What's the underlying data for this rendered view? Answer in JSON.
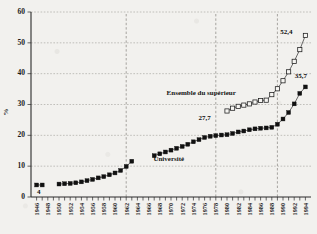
{
  "chart_data": {
    "type": "line",
    "title": "",
    "xlabel": "",
    "ylabel": "%",
    "ylim": [
      0,
      60
    ],
    "xlim": [
      1945,
      1995
    ],
    "ytick_values": [
      0,
      10,
      20,
      30,
      40,
      50,
      60
    ],
    "ytick_labels": [
      "0",
      "10",
      "20",
      "30",
      "40",
      "50",
      "60"
    ],
    "xtick_labels": [
      "1946",
      "1948",
      "1950",
      "1952",
      "1954",
      "1956",
      "1958",
      "1960",
      "1962",
      "1964",
      "1966",
      "1968",
      "1970",
      "1972",
      "1974",
      "1976",
      "1978",
      "1980",
      "1982",
      "1984",
      "1986",
      "1988",
      "1990",
      "1992",
      "1994"
    ],
    "grid": "horizontal-dashed",
    "legend": "inline-annotations",
    "series": [
      {
        "name": "Université",
        "marker": "filled-square",
        "x": [
          1946,
          1947,
          1950,
          1951,
          1952,
          1953,
          1954,
          1955,
          1956,
          1957,
          1958,
          1959,
          1960,
          1961,
          1962,
          1963,
          1967,
          1968,
          1969,
          1970,
          1971,
          1972,
          1973,
          1974,
          1975,
          1976,
          1977,
          1978,
          1979,
          1980,
          1981,
          1982,
          1983,
          1984,
          1985,
          1986,
          1987,
          1988,
          1989,
          1990,
          1991,
          1992,
          1993,
          1994
        ],
        "values": [
          3.9,
          3.9,
          4.2,
          4.3,
          4.4,
          4.6,
          4.9,
          5.3,
          5.7,
          6.2,
          6.6,
          7.2,
          7.8,
          8.6,
          9.9,
          11.6,
          13.4,
          14.0,
          14.6,
          15.2,
          15.8,
          16.4,
          17.1,
          17.9,
          18.6,
          19.3,
          19.7,
          19.9,
          20.1,
          20.2,
          20.6,
          21.1,
          21.4,
          21.8,
          22.1,
          22.3,
          22.4,
          22.6,
          23.6,
          25.3,
          27.4,
          30.2,
          33.6,
          35.7
        ]
      },
      {
        "name": "Ensemble du supérieur",
        "marker": "open-square",
        "x": [
          1980,
          1981,
          1982,
          1983,
          1984,
          1985,
          1986,
          1987,
          1988,
          1989,
          1990,
          1991,
          1992,
          1993,
          1994
        ],
        "values": [
          27.9,
          28.8,
          29.4,
          29.8,
          30.2,
          30.8,
          31.3,
          31.4,
          33.2,
          35.1,
          37.7,
          40.6,
          44.0,
          47.8,
          52.4
        ]
      }
    ],
    "reference_lines": [
      {
        "name": "ref-1962",
        "x": 1962
      },
      {
        "name": "ref-1978",
        "x": 1978
      },
      {
        "name": "ref-1989",
        "x": 1989
      }
    ],
    "annotations": [
      {
        "name": "annotation-start-value",
        "text": "4",
        "x": 1946.4,
        "y": 1.1
      },
      {
        "name": "annotation-1978-value",
        "text": "27,7",
        "x": 1976.0,
        "y": 25.0
      },
      {
        "name": "annotation-max-superieur",
        "text": "52,4",
        "x": 1990.6,
        "y": 52.8
      },
      {
        "name": "annotation-max-universite",
        "text": "35,7",
        "x": 1993.2,
        "y": 38.6
      },
      {
        "name": "series-label-superieur",
        "text": "Ensemble du supérieur",
        "x": 1975.4,
        "y": 33.0
      },
      {
        "name": "series-label-universite",
        "text": "Université",
        "x": 1969.6,
        "y": 11.6
      }
    ]
  }
}
